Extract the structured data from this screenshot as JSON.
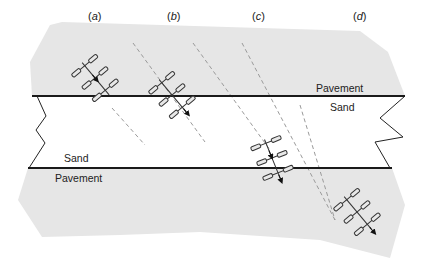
{
  "diagram": {
    "panels": [
      {
        "id": "a",
        "label_open": "(",
        "letter": "a",
        "label_close": ")"
      },
      {
        "id": "b",
        "label_open": "(",
        "letter": "b",
        "label_close": ")"
      },
      {
        "id": "c",
        "label_open": "(",
        "letter": "c",
        "label_close": ")"
      },
      {
        "id": "d",
        "label_open": "(",
        "letter": "d",
        "label_close": ")"
      }
    ],
    "regions": {
      "top_pavement_label": "Pavement",
      "top_sand_label": "Sand",
      "bottom_sand_label": "Sand",
      "bottom_pavement_label": "Pavement"
    },
    "colors": {
      "pavement_fill": "#e6e6e6",
      "sand_fill": "#ffffff",
      "boundary_line": "#1a1a1a",
      "dashed_path": "#9a9a9a",
      "vehicle_stroke": "#333333",
      "wheel_fill": "#e8e8e8"
    }
  }
}
